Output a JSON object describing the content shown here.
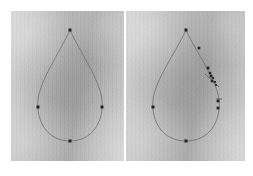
{
  "figure": {
    "caption": "",
    "background_color": "#ffffff",
    "width": 253,
    "height": 176,
    "panel_count": 2,
    "curve_color": "#6f6f6f",
    "marker_color": "#252525",
    "panel_fill": "#b9b9b9"
  },
  "panels": [
    {
      "id": "left-panel",
      "name": "initial-contour-panel",
      "label": "",
      "x": 11,
      "y": 11,
      "width": 113,
      "height": 150,
      "shape": {
        "name": "teardrop-contour",
        "path": "M 70 30 C 60 52 40 80 38 100 C 36 122 48 141 70 141 C 92 141 104 122 102 100 C 100 80 80 52 70 30 Z"
      },
      "markers": [
        {
          "name": "apex-control-point",
          "x": 70,
          "y": 30,
          "size": 3.0
        },
        {
          "name": "left-control-point",
          "x": 38,
          "y": 107,
          "size": 3.0
        },
        {
          "name": "right-control-point",
          "x": 102,
          "y": 107,
          "size": 3.0
        },
        {
          "name": "bottom-control-point",
          "x": 70,
          "y": 141,
          "size": 3.0
        }
      ],
      "leaders": []
    },
    {
      "id": "right-panel",
      "name": "tracked-contour-panel",
      "label": "",
      "x": 126,
      "y": 11,
      "width": 119,
      "height": 150,
      "shape": {
        "name": "teardrop-contour",
        "path": "M 186 30 C 176 52 155 80 153 100 C 151 122 163 141 186 141 C 209 141 221 122 219 100 C 217 80 196 52 186 30 Z"
      },
      "markers": [
        {
          "name": "apex-control-point",
          "x": 186,
          "y": 30,
          "size": 3.0
        },
        {
          "name": "left-control-point",
          "x": 153,
          "y": 107,
          "size": 3.0
        },
        {
          "name": "bottom-control-point",
          "x": 186,
          "y": 141,
          "size": 3.0
        },
        {
          "name": "upper-edge-tracked-point",
          "x": 199,
          "y": 48,
          "size": 2.6
        },
        {
          "name": "cluster-tracked-point-1",
          "x": 208,
          "y": 68,
          "size": 2.8
        },
        {
          "name": "cluster-tracked-point-2",
          "x": 210,
          "y": 73,
          "size": 2.4
        },
        {
          "name": "cluster-tracked-point-3",
          "x": 211,
          "y": 76,
          "size": 2.8
        },
        {
          "name": "cluster-tracked-point-4",
          "x": 213,
          "y": 78,
          "size": 2.2
        },
        {
          "name": "cluster-tracked-point-5",
          "x": 212,
          "y": 81,
          "size": 2.6
        },
        {
          "name": "cluster-tracked-point-6",
          "x": 215,
          "y": 82,
          "size": 2.0
        },
        {
          "name": "cluster-tracked-point-7",
          "x": 216,
          "y": 85,
          "size": 1.8
        },
        {
          "name": "right-control-point-upper",
          "x": 218,
          "y": 101,
          "size": 2.8
        },
        {
          "name": "right-control-point-lower",
          "x": 218,
          "y": 108,
          "size": 2.8
        }
      ],
      "leaders": [
        {
          "name": "cluster-leader-line",
          "x1": 205,
          "y1": 74,
          "x2": 219,
          "y2": 87
        },
        {
          "name": "right-point-leader-line",
          "x1": 216,
          "y1": 99,
          "x2": 222,
          "y2": 99
        }
      ]
    }
  ],
  "chart_data": {
    "type": "scatter",
    "xlabel": "",
    "ylabel": "",
    "grid": false,
    "legend": "none",
    "note": "Two photographic frames of the same teardrop outline; left shows 4 contour control points, right shows the same 4 plus a cluster of tracked points along the upper-right contour edge.",
    "series": [
      {
        "name": "left-frame-control-points",
        "x": [
          70,
          38,
          102,
          70
        ],
        "y": [
          30,
          107,
          107,
          141
        ]
      },
      {
        "name": "right-frame-control-points",
        "x": [
          186,
          153,
          218,
          186
        ],
        "y": [
          30,
          107,
          104,
          141
        ]
      },
      {
        "name": "right-frame-tracked-cluster",
        "x": [
          199,
          208,
          210,
          211,
          213,
          212,
          215,
          216,
          218,
          218
        ],
        "y": [
          48,
          68,
          73,
          76,
          78,
          81,
          82,
          85,
          101,
          108
        ]
      }
    ]
  }
}
